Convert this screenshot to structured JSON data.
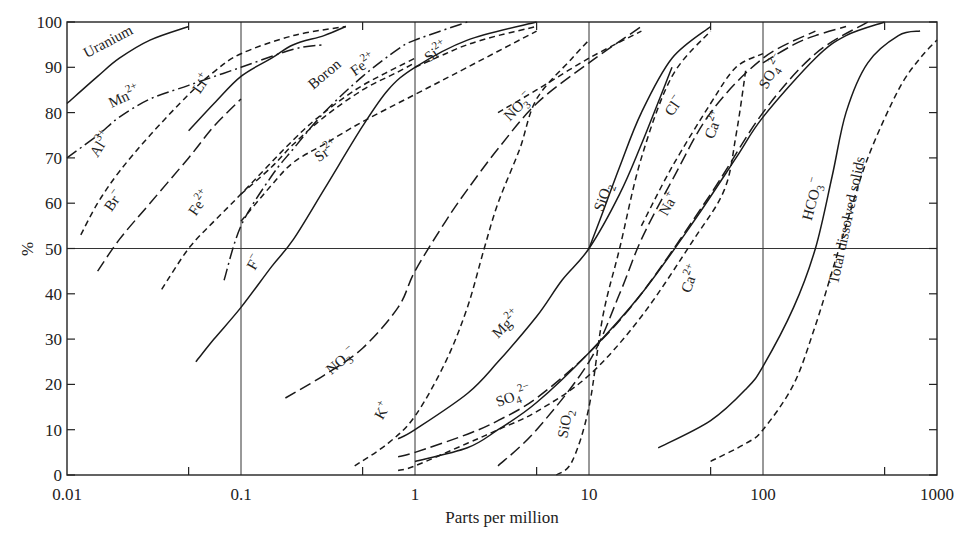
{
  "chart_data": {
    "type": "line",
    "title": "",
    "xlabel": "Parts per million",
    "ylabel": "%",
    "xscale": "log",
    "xlim": [
      0.01,
      1000
    ],
    "ylim": [
      0,
      100
    ],
    "xticks": [
      "0.01",
      "0.1",
      "1",
      "10",
      "100",
      "1000"
    ],
    "yticks": [
      "0",
      "10",
      "20",
      "30",
      "40",
      "50",
      "60",
      "70",
      "80",
      "90",
      "100"
    ],
    "grid": "vertical lines at decades, horizontal line at 50%",
    "legend": "none (inline curve labels)",
    "series": [
      {
        "name": "Uranium",
        "style": "solid",
        "x": [
          0.01,
          0.015,
          0.02,
          0.03,
          0.05
        ],
        "y": [
          82,
          88,
          92,
          96,
          99
        ],
        "label": {
          "text": "Uranium",
          "x": 0.013,
          "y": 92,
          "angle": -28
        }
      },
      {
        "name": "Mn2+",
        "style": "dashdot",
        "x": [
          0.01,
          0.015,
          0.02,
          0.03,
          0.05,
          0.1,
          0.2,
          0.3
        ],
        "y": [
          70,
          75,
          79,
          83,
          86,
          90,
          94,
          95
        ],
        "label": {
          "text": "Mn2+",
          "x": 0.018,
          "y": 81,
          "angle": -25
        }
      },
      {
        "name": "Li+",
        "style": "solid",
        "x": [
          0.05,
          0.07,
          0.1,
          0.15,
          0.2,
          0.3,
          0.4
        ],
        "y": [
          76,
          82,
          88,
          92,
          95,
          97,
          99
        ],
        "label": {
          "text": "Li+",
          "x": 0.058,
          "y": 84,
          "angle": -55
        }
      },
      {
        "name": "Al3+",
        "style": "dashed",
        "x": [
          0.012,
          0.015,
          0.02,
          0.03,
          0.05,
          0.07,
          0.1,
          0.2,
          0.4
        ],
        "y": [
          53,
          60,
          67,
          75,
          84,
          89,
          93,
          97,
          99
        ],
        "label": {
          "text": "Al3+",
          "x": 0.015,
          "y": 70,
          "angle": -58
        }
      },
      {
        "name": "Br-",
        "style": "longdash",
        "x": [
          0.015,
          0.02,
          0.03,
          0.05,
          0.07,
          0.1
        ],
        "y": [
          45,
          52,
          60,
          70,
          77,
          83
        ],
        "label": {
          "text": "Br-",
          "x": 0.018,
          "y": 58,
          "angle": -55
        }
      },
      {
        "name": "Fe2+ (low)",
        "style": "dashed",
        "x": [
          0.035,
          0.05,
          0.07,
          0.1,
          0.2,
          0.3,
          0.5,
          1.0
        ],
        "y": [
          41,
          50,
          56,
          62,
          74,
          80,
          86,
          92
        ],
        "label": {
          "text": "Fe2+",
          "x": 0.055,
          "y": 57,
          "angle": -55
        }
      },
      {
        "name": "Boron",
        "style": "dashdot",
        "x": [
          0.08,
          0.1,
          0.15,
          0.2,
          0.3,
          0.5,
          0.8,
          1.0,
          2.0
        ],
        "y": [
          43,
          55,
          66,
          72,
          80,
          88,
          94,
          96,
          100
        ],
        "label": {
          "text": "Boron",
          "x": 0.26,
          "y": 85,
          "angle": -40
        }
      },
      {
        "name": "Fe2+ (high)",
        "style": "dashed",
        "x": [
          0.1,
          0.15,
          0.2,
          0.3,
          0.5,
          0.8,
          1.0
        ],
        "y": [
          62,
          68,
          73,
          79,
          85,
          89,
          91
        ],
        "label": {
          "text": "Fe2+",
          "x": 0.45,
          "y": 88,
          "angle": -35
        }
      },
      {
        "name": "Sr2+",
        "style": "dashed",
        "x": [
          0.1,
          0.15,
          0.2,
          0.3,
          0.5,
          1.0,
          2.0,
          5.0
        ],
        "y": [
          56,
          64,
          69,
          73,
          78,
          84,
          90,
          98
        ],
        "label": {
          "text": "Sr2+",
          "x": 0.28,
          "y": 69,
          "angle": -35
        }
      },
      {
        "name": "F-",
        "style": "solid",
        "x": [
          0.055,
          0.07,
          0.1,
          0.15,
          0.2,
          0.3,
          0.5,
          0.7,
          1.0,
          2.0,
          5.0
        ],
        "y": [
          25,
          30,
          37,
          46,
          52,
          63,
          77,
          85,
          90,
          96,
          100
        ],
        "label": {
          "text": "F-",
          "x": 0.12,
          "y": 45,
          "angle": -60
        }
      },
      {
        "name": "Si2+",
        "style": "dashed",
        "x": [
          1.0,
          1.5,
          2.0,
          3.0,
          5.0
        ],
        "y": [
          90,
          93,
          95,
          97,
          99
        ],
        "label": {
          "text": "Si2+",
          "x": 1.2,
          "y": 91,
          "angle": -35
        }
      },
      {
        "name": "NO3- (low)",
        "style": "longdash",
        "x": [
          0.18,
          0.3,
          0.5,
          0.8,
          1.0,
          1.5,
          2.0,
          3.0,
          5.0,
          10.0,
          20.0
        ],
        "y": [
          17,
          22,
          28,
          37,
          45,
          56,
          63,
          72,
          82,
          91,
          99
        ],
        "label": {
          "text": "NO3-",
          "x": 0.33,
          "y": 22,
          "angle": -40
        }
      },
      {
        "name": "NO3- (high)",
        "style": "dashed",
        "x": [
          3.0,
          5.0,
          10.0,
          20.0
        ],
        "y": [
          80,
          85,
          92,
          98
        ],
        "label": {
          "text": "NO3-",
          "x": 3.5,
          "y": 78,
          "angle": -45
        }
      },
      {
        "name": "K+",
        "style": "dashed",
        "x": [
          0.45,
          0.7,
          1.0,
          1.5,
          2.0,
          2.5,
          3.0,
          4.0,
          5.0,
          8.0,
          10.0
        ],
        "y": [
          2,
          7,
          13,
          25,
          37,
          50,
          60,
          72,
          83,
          92,
          96
        ],
        "label": {
          "text": "K+",
          "x": 0.65,
          "y": 12,
          "angle": -60
        }
      },
      {
        "name": "Mg2+",
        "style": "solid",
        "x": [
          0.8,
          1.0,
          2.0,
          3.0,
          5.0,
          7.0,
          10.0,
          15.0,
          20.0,
          30.0
        ],
        "y": [
          8,
          10,
          18,
          25,
          35,
          43,
          50,
          62,
          73,
          90
        ],
        "label": {
          "text": "Mg2+",
          "x": 3.0,
          "y": 30,
          "angle": -45
        }
      },
      {
        "name": "SiO2 (upper)",
        "style": "solid",
        "x": [
          10.0,
          12.0,
          15.0,
          20.0,
          30.0,
          50.0
        ],
        "y": [
          50,
          58,
          68,
          80,
          92,
          99
        ],
        "label": {
          "text": "SiO2",
          "x": 12.0,
          "y": 58,
          "angle": -70
        }
      },
      {
        "name": "SiO2 (lower)",
        "style": "dashed",
        "x": [
          6.5,
          8.0,
          10.0,
          12.0,
          15.0,
          20.0,
          30.0,
          50.0
        ],
        "y": [
          0,
          3,
          15,
          35,
          50,
          70,
          88,
          98
        ],
        "label": {
          "text": "SiO2",
          "x": 7.5,
          "y": 8,
          "angle": -80
        }
      },
      {
        "name": "SO42- (low)",
        "style": "longdash",
        "x": [
          0.8,
          1.0,
          2.0,
          3.0,
          5.0,
          10.0,
          20.0,
          50.0,
          100.0,
          200.0,
          400.0
        ],
        "y": [
          4,
          5,
          9,
          12,
          17,
          27,
          40,
          62,
          80,
          93,
          100
        ],
        "label": {
          "text": "SO42-",
          "x": 3.0,
          "y": 15,
          "angle": -20
        }
      },
      {
        "name": "SO42- (high)",
        "style": "longdash",
        "x": [
          100.0,
          150.0,
          200.0,
          300.0
        ],
        "y": [
          91,
          95,
          97,
          99
        ],
        "label": {
          "text": "SO42-",
          "x": 105.0,
          "y": 85,
          "angle": -60
        }
      },
      {
        "name": "Na+",
        "style": "solid",
        "x": [
          1.0,
          2.0,
          3.0,
          5.0,
          10.0,
          20.0,
          40.0,
          70.0,
          100.0,
          200.0,
          300.0,
          500.0
        ],
        "y": [
          3,
          6,
          10,
          16,
          27,
          40,
          56,
          70,
          79,
          92,
          97,
          100
        ],
        "label": {
          "text": "Na+",
          "x": 28.0,
          "y": 57,
          "angle": -60
        }
      },
      {
        "name": "Ca2+ (low)",
        "style": "dashed",
        "x": [
          0.8,
          1.0,
          2.0,
          3.0,
          5.0,
          10.0,
          20.0,
          40.0,
          60.0,
          70.0,
          80.0
        ],
        "y": [
          1,
          2,
          7,
          10,
          14,
          22,
          35,
          52,
          63,
          75,
          90
        ],
        "label": {
          "text": "Ca2+",
          "x": 38.0,
          "y": 40,
          "angle": -70
        }
      },
      {
        "name": "Ca2+ (high)",
        "style": "dashed",
        "x": [
          20.0,
          30.0,
          50.0,
          70.0,
          100.0
        ],
        "y": [
          55,
          68,
          82,
          90,
          93
        ],
        "label": {
          "text": "Ca2+",
          "x": 52.0,
          "y": 74,
          "angle": -70
        }
      },
      {
        "name": "Cl-",
        "style": "longdash",
        "x": [
          3.0,
          5.0,
          10.0,
          15.0,
          20.0,
          30.0,
          50.0,
          100.0,
          200.0
        ],
        "y": [
          2,
          10,
          25,
          40,
          52,
          65,
          80,
          92,
          98
        ],
        "label": {
          "text": "Cl-",
          "x": 30.0,
          "y": 79,
          "angle": -55
        }
      },
      {
        "name": "HCO3-",
        "style": "solid",
        "x": [
          25.0,
          50.0,
          80.0,
          100.0,
          150.0,
          200.0,
          250.0,
          300.0,
          400.0,
          600.0,
          800.0
        ],
        "y": [
          6,
          12,
          19,
          24,
          37,
          50,
          66,
          80,
          91,
          97,
          98
        ],
        "label": {
          "text": "HCO3-",
          "x": 190.0,
          "y": 56,
          "angle": -75
        }
      },
      {
        "name": "Total dissolved solids",
        "style": "dashed",
        "x": [
          50.0,
          80.0,
          100.0,
          150.0,
          200.0,
          250.0,
          300.0,
          400.0,
          600.0,
          800.0,
          1000.0
        ],
        "y": [
          3,
          7,
          10,
          20,
          33,
          45,
          55,
          70,
          85,
          92,
          96
        ],
        "label": {
          "text": "Total dissolved solids",
          "x": 270.0,
          "y": 42,
          "angle": -78
        }
      }
    ]
  }
}
